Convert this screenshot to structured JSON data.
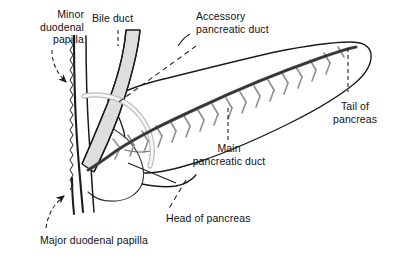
{
  "figure": {
    "background_color": "#ffffff",
    "ink_color": "#1a1a1a",
    "duct_fill_color": "#d9d9d9",
    "accessory_duct_color": "#f2f2f2",
    "branch_color": "#8c8c8c"
  },
  "labels": {
    "minor_duodenal_papilla": "Minor\nduodenal\npapilla",
    "bile_duct": "Bile duct",
    "accessory_pancreatic_duct": "Accessory\npancreatic duct",
    "tail_of_pancreas": "Tail of\npancreas",
    "main_pancreatic_duct": "Main\npancreatic duct",
    "head_of_pancreas": "Head of pancreas",
    "major_duodenal_papilla": "Major duodenal papilla"
  },
  "structures": [
    {
      "name": "duodenum",
      "description": "C-shaped duodenal wall on the left with wavy mucosal inner margin"
    },
    {
      "name": "bile-duct",
      "description": "Gray tubular duct descending diagonally into the duodenum"
    },
    {
      "name": "accessory-pancreatic-duct",
      "description": "Pale duct curving from minor papilla to main duct"
    },
    {
      "name": "main-pancreatic-duct",
      "description": "Dark duct running the length of the pancreas with feather-like side branches"
    },
    {
      "name": "pancreas-body-tail",
      "description": "Elongated tapering pancreatic body and tail outline"
    },
    {
      "name": "pancreas-head",
      "description": "Rounded head of pancreas nestled in the duodenal curve"
    }
  ]
}
